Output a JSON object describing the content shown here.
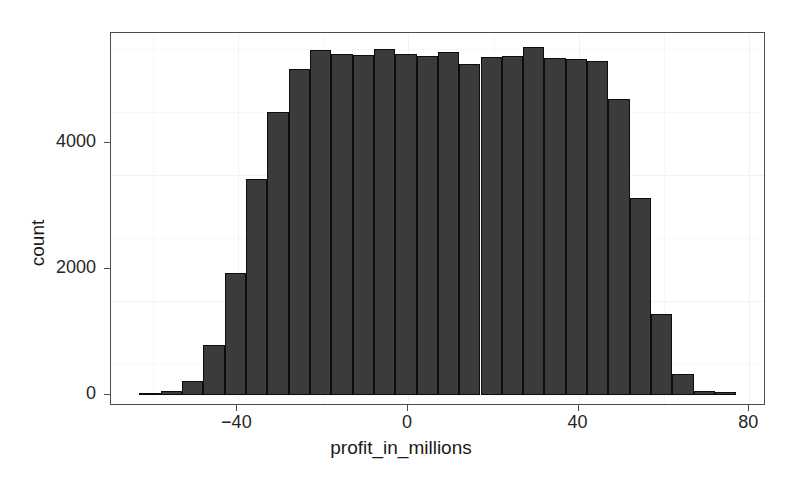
{
  "chart_data": {
    "type": "bar",
    "title": "",
    "subtitle": "",
    "xlabel": "profit_in_millions",
    "ylabel": "count",
    "grid": true,
    "legend": "none",
    "xlim": [
      -63,
      77
    ],
    "ylim": [
      0,
      5800
    ],
    "xticks": [
      -40,
      0,
      40,
      80
    ],
    "xtick_labels": [
      "−40",
      "0",
      "40",
      "80"
    ],
    "yticks": [
      0,
      2000,
      4000
    ],
    "ytick_labels": [
      "0",
      "2000",
      "4000"
    ],
    "bin_width": 5,
    "bar_color": "#3b3b3b",
    "bar_edge_color": "#0d0d0d",
    "categories": [
      "-63",
      "-58",
      "-53",
      "-48",
      "-43",
      "-38",
      "-33",
      "-28",
      "-23",
      "-18",
      "-13",
      "-8",
      "-3",
      "2",
      "7",
      "12",
      "17",
      "22",
      "27",
      "32",
      "37",
      "42",
      "47",
      "52",
      "57",
      "62",
      "67",
      "72"
    ],
    "bin_centers": [
      -60.5,
      -55.5,
      -50.5,
      -45.5,
      -40.5,
      -35.5,
      -30.5,
      -25.5,
      -20.5,
      -15.5,
      -10.5,
      -5.5,
      -0.5,
      4.5,
      9.5,
      14.5,
      19.5,
      24.5,
      29.5,
      34.5,
      39.5,
      44.5,
      49.5,
      54.5,
      59.5,
      64.5,
      69.5,
      74.5
    ],
    "values": [
      30,
      60,
      230,
      800,
      1940,
      3430,
      4500,
      5170,
      5480,
      5420,
      5400,
      5500,
      5420,
      5380,
      5450,
      5250,
      5370,
      5380,
      5530,
      5350,
      5330,
      5300,
      4700,
      3130,
      1280,
      330,
      70,
      40
    ]
  },
  "axes": {
    "x_title": "profit_in_millions",
    "y_title": "count"
  }
}
